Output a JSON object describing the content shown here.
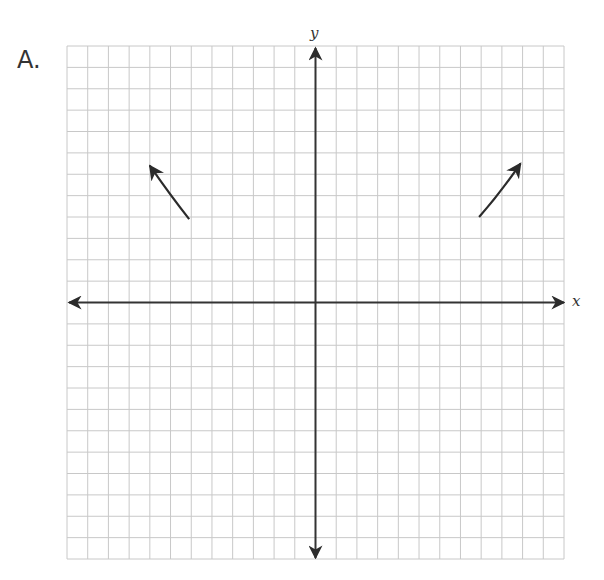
{
  "problem_label": "A.",
  "chart_data": {
    "type": "line",
    "title": "",
    "xlabel": "x",
    "ylabel": "y",
    "xlim": [
      -12,
      12
    ],
    "ylim": [
      -12,
      12
    ],
    "grid": true,
    "grid_step": 1,
    "series": [
      {
        "name": "left branch",
        "points": [
          [
            -6.1,
            3.9
          ],
          [
            -7.0,
            5.0
          ],
          [
            -8.0,
            6.4
          ]
        ],
        "arrow_end": true
      },
      {
        "name": "right branch",
        "points": [
          [
            7.9,
            4.0
          ],
          [
            8.9,
            5.1
          ],
          [
            9.9,
            6.5
          ]
        ],
        "arrow_end": true
      }
    ]
  },
  "colors": {
    "grid": "#c8c8c8",
    "axis": "#333333",
    "curve": "#2b2b2b"
  }
}
